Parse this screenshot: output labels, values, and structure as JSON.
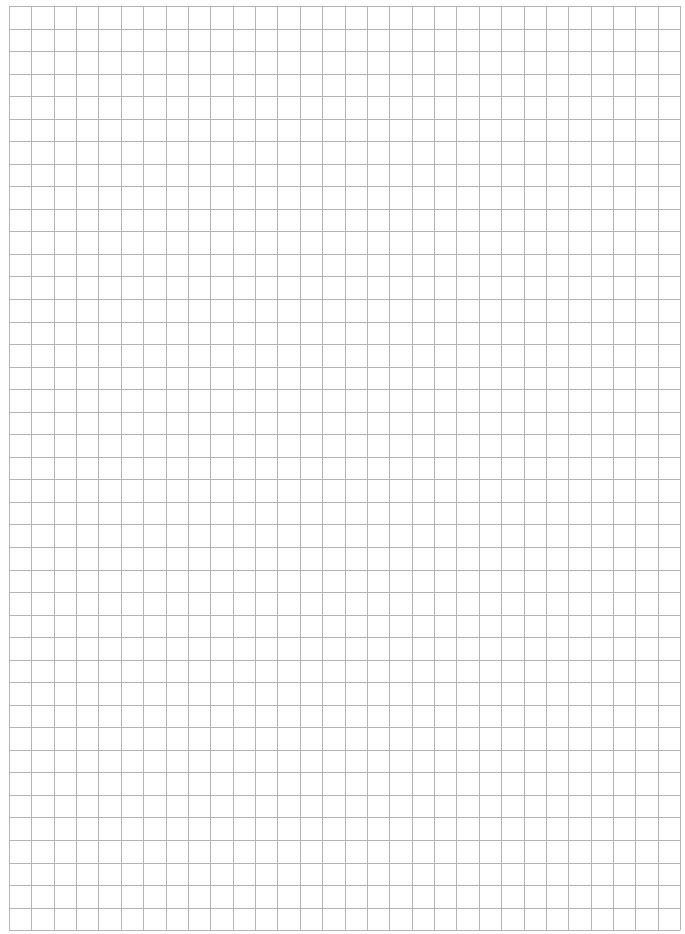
{
  "page": {
    "type": "graph-paper",
    "background": "#ffffff"
  },
  "grid": {
    "left": 9,
    "top": 6,
    "columns": 30,
    "rows": 41,
    "cell_width": 22.37,
    "cell_height": 22.54,
    "line_color": "#b4b4b4",
    "line_width": 1
  }
}
